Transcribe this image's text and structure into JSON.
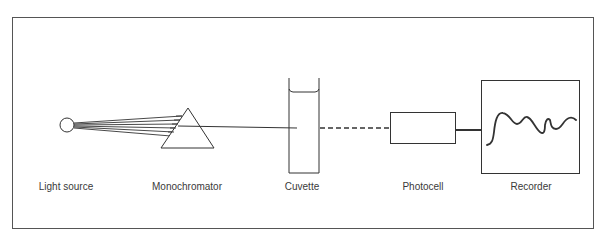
{
  "diagram": {
    "type": "block-flow",
    "title": "",
    "colors": {
      "stroke": "#333333",
      "frame": "#555555",
      "background": "#ffffff"
    },
    "components": [
      {
        "id": "light_source",
        "label": "Light source",
        "shape": "circle"
      },
      {
        "id": "monochromator",
        "label": "Monochromator",
        "shape": "triangle-prism"
      },
      {
        "id": "cuvette",
        "label": "Cuvette",
        "shape": "open-top-container"
      },
      {
        "id": "photocell",
        "label": "Photocell",
        "shape": "rectangle"
      },
      {
        "id": "recorder",
        "label": "Recorder",
        "shape": "square-with-trace"
      }
    ],
    "connections": [
      {
        "from": "light_source",
        "to": "monochromator",
        "style": "ray-fan"
      },
      {
        "from": "monochromator",
        "to": "cuvette",
        "style": "solid"
      },
      {
        "from": "cuvette",
        "to": "photocell",
        "style": "dashed"
      },
      {
        "from": "photocell",
        "to": "recorder",
        "style": "solid-thick"
      }
    ]
  }
}
